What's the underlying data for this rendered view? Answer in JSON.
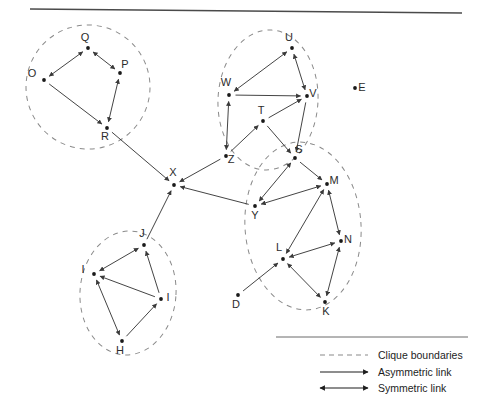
{
  "figure": {
    "title": "",
    "top_rule": true,
    "background_color": "#ffffff",
    "line_color": "#3a3a3a",
    "clique_boundary_color": "#8a8a8a",
    "node_color": "#1a1a1a"
  },
  "graph": {
    "type": "directed-network",
    "node_count": 23,
    "nodes": [
      {
        "id": "Q",
        "label": "Q",
        "x": 88,
        "y": 48,
        "label_dx": -3,
        "label_dy": -7,
        "clique": "OPQR"
      },
      {
        "id": "P",
        "label": "P",
        "x": 120,
        "y": 73,
        "label_dx": 5,
        "label_dy": -5,
        "clique": "OPQR"
      },
      {
        "id": "O",
        "label": "O",
        "x": 44,
        "y": 80,
        "label_dx": -12,
        "label_dy": -3,
        "clique": "OPQR"
      },
      {
        "id": "R",
        "label": "R",
        "x": 107,
        "y": 128,
        "label_dx": -2,
        "label_dy": 12,
        "clique": "OPQR"
      },
      {
        "id": "U",
        "label": "U",
        "x": 292,
        "y": 48,
        "label_dx": -3,
        "label_dy": -7,
        "clique": "TUVWZ"
      },
      {
        "id": "W",
        "label": "W",
        "x": 229,
        "y": 95,
        "label_dx": -3,
        "label_dy": -9,
        "clique": "TUVWZ"
      },
      {
        "id": "V",
        "label": "V",
        "x": 307,
        "y": 96,
        "label_dx": 6,
        "label_dy": 1,
        "clique": "TUVWZ"
      },
      {
        "id": "T",
        "label": "T",
        "x": 263,
        "y": 121,
        "label_dx": -2,
        "label_dy": -7,
        "clique": "TUVWZ"
      },
      {
        "id": "Z",
        "label": "Z",
        "x": 226,
        "y": 156,
        "label_dx": 5,
        "label_dy": 7,
        "clique": "TUVWZ"
      },
      {
        "id": "E",
        "label": "E",
        "x": 355,
        "y": 88,
        "label_dx": 7,
        "label_dy": 3,
        "clique": "none"
      },
      {
        "id": "S",
        "label": "S",
        "x": 295,
        "y": 158,
        "label_dx": 4,
        "label_dy": -5,
        "clique": "KLMNSY"
      },
      {
        "id": "M",
        "label": "M",
        "x": 327,
        "y": 184,
        "label_dx": 7,
        "label_dy": 0,
        "clique": "KLMNSY"
      },
      {
        "id": "Y",
        "label": "Y",
        "x": 255,
        "y": 206,
        "label_dx": 0,
        "label_dy": 13,
        "clique": "KLMNSY"
      },
      {
        "id": "N",
        "label": "N",
        "x": 341,
        "y": 241,
        "label_dx": 7,
        "label_dy": 2,
        "clique": "KLMNSY"
      },
      {
        "id": "L",
        "label": "L",
        "x": 283,
        "y": 259,
        "label_dx": -4,
        "label_dy": -8,
        "clique": "KLMNSY"
      },
      {
        "id": "K",
        "label": "K",
        "x": 325,
        "y": 302,
        "label_dx": 1,
        "label_dy": 13,
        "clique": "KLMNSY"
      },
      {
        "id": "D",
        "label": "D",
        "x": 238,
        "y": 295,
        "label_dx": -2,
        "label_dy": 13,
        "clique": "none"
      },
      {
        "id": "X",
        "label": "X",
        "x": 174,
        "y": 185,
        "label_dx": -1,
        "label_dy": -9,
        "clique": "none"
      },
      {
        "id": "J",
        "label": "J",
        "x": 144,
        "y": 245,
        "label_dx": -2,
        "label_dy": -8,
        "clique": "HIJI2"
      },
      {
        "id": "I1",
        "label": "I",
        "x": 94,
        "y": 274,
        "label_dx": -11,
        "label_dy": -1,
        "clique": "HIJI2"
      },
      {
        "id": "I2",
        "label": "I",
        "x": 161,
        "y": 299,
        "label_dx": 7,
        "label_dy": 2,
        "clique": "HIJI2"
      },
      {
        "id": "H",
        "label": "H",
        "x": 122,
        "y": 341,
        "label_dx": -2,
        "label_dy": 13,
        "clique": "HIJI2"
      }
    ],
    "edges": [
      {
        "from": "O",
        "to": "Q",
        "kind": "symmetric"
      },
      {
        "from": "Q",
        "to": "P",
        "kind": "symmetric"
      },
      {
        "from": "P",
        "to": "R",
        "kind": "symmetric"
      },
      {
        "from": "O",
        "to": "R",
        "kind": "asymmetric"
      },
      {
        "from": "R",
        "to": "X",
        "kind": "asymmetric"
      },
      {
        "from": "W",
        "to": "U",
        "kind": "symmetric"
      },
      {
        "from": "U",
        "to": "V",
        "kind": "symmetric"
      },
      {
        "from": "W",
        "to": "V",
        "kind": "asymmetric"
      },
      {
        "from": "W",
        "to": "Z",
        "kind": "symmetric"
      },
      {
        "from": "T",
        "to": "V",
        "kind": "asymmetric"
      },
      {
        "from": "T",
        "to": "S",
        "kind": "asymmetric"
      },
      {
        "from": "Z",
        "to": "T",
        "kind": "asymmetric"
      },
      {
        "from": "Z",
        "to": "X",
        "kind": "asymmetric"
      },
      {
        "from": "V",
        "to": "S",
        "kind": "asymmetric"
      },
      {
        "from": "S",
        "to": "Y",
        "kind": "symmetric"
      },
      {
        "from": "S",
        "to": "M",
        "kind": "asymmetric"
      },
      {
        "from": "Y",
        "to": "M",
        "kind": "symmetric"
      },
      {
        "from": "Y",
        "to": "X",
        "kind": "asymmetric"
      },
      {
        "from": "M",
        "to": "L",
        "kind": "symmetric"
      },
      {
        "from": "M",
        "to": "N",
        "kind": "symmetric"
      },
      {
        "from": "N",
        "to": "L",
        "kind": "symmetric"
      },
      {
        "from": "N",
        "to": "K",
        "kind": "symmetric"
      },
      {
        "from": "L",
        "to": "K",
        "kind": "symmetric"
      },
      {
        "from": "D",
        "to": "L",
        "kind": "asymmetric"
      },
      {
        "from": "J",
        "to": "X",
        "kind": "asymmetric"
      },
      {
        "from": "J",
        "to": "I1",
        "kind": "symmetric"
      },
      {
        "from": "I2",
        "to": "J",
        "kind": "asymmetric"
      },
      {
        "from": "I2",
        "to": "I1",
        "kind": "asymmetric"
      },
      {
        "from": "I1",
        "to": "H",
        "kind": "symmetric"
      },
      {
        "from": "H",
        "to": "I2",
        "kind": "asymmetric"
      }
    ],
    "cliques": [
      {
        "name": "OPQR",
        "cx": 88,
        "cy": 87,
        "rx": 62,
        "ry": 62,
        "rot": -18
      },
      {
        "name": "TUVWZ",
        "cx": 268,
        "cy": 100,
        "rx": 50,
        "ry": 70,
        "rot": 3
      },
      {
        "name": "KLMNSY",
        "cx": 303,
        "cy": 226,
        "rx": 58,
        "ry": 84,
        "rot": -4
      },
      {
        "name": "HIJI2",
        "cx": 128,
        "cy": 293,
        "rx": 48,
        "ry": 62,
        "rot": 4
      }
    ]
  },
  "legend": {
    "items": [
      {
        "key": "clique-boundaries",
        "label": "Clique boundaries",
        "style": "dashed"
      },
      {
        "key": "asymmetric-link",
        "label": "Asymmetric link",
        "style": "single-arrow"
      },
      {
        "key": "symmetric-link",
        "label": "Symmetric link",
        "style": "double-arrow"
      }
    ]
  }
}
